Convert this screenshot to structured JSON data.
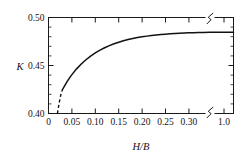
{
  "chart_data": {
    "type": "line",
    "title": "",
    "xlabel": "H/B",
    "ylabel": "K",
    "xlim": [
      0,
      0.345
    ],
    "ylim": [
      0.4,
      0.5
    ],
    "grid": false,
    "legend": null,
    "axis_break": {
      "axis": "x",
      "present": true,
      "between": [
        0.3,
        1.0
      ],
      "note": "zigzag break on top and bottom axis after 0.30"
    },
    "xticks": [
      0,
      0.05,
      0.1,
      0.15,
      0.2,
      0.25,
      0.3,
      1.0
    ],
    "xtick_labels": [
      "0",
      "0.05",
      "0.10",
      "0.15",
      "0.20",
      "0.25",
      "0.30",
      "1.0"
    ],
    "yticks": [
      0.4,
      0.45,
      0.5
    ],
    "ytick_labels": [
      "0.40",
      "0.45",
      "0.50"
    ],
    "y_minor_step": 0.01,
    "series": [
      {
        "name": "K vs H/B",
        "style": "solid",
        "x": [
          0.03,
          0.035,
          0.04,
          0.045,
          0.05,
          0.06,
          0.07,
          0.08,
          0.09,
          0.1,
          0.11,
          0.12,
          0.13,
          0.14,
          0.15,
          0.16,
          0.17,
          0.18,
          0.19,
          0.2,
          0.21,
          0.22,
          0.23,
          0.24,
          0.25,
          0.26,
          0.27,
          0.28,
          0.29,
          0.3,
          0.31,
          0.32,
          0.33,
          0.345
        ],
        "y": [
          0.425,
          0.4294,
          0.4334,
          0.4371,
          0.4405,
          0.4465,
          0.4516,
          0.456,
          0.4598,
          0.4631,
          0.466,
          0.4685,
          0.4707,
          0.4726,
          0.4743,
          0.4757,
          0.477,
          0.4781,
          0.4791,
          0.4799,
          0.4806,
          0.4812,
          0.4818,
          0.4822,
          0.4826,
          0.483,
          0.4833,
          0.4836,
          0.4838,
          0.484,
          0.4842,
          0.4844,
          0.4845,
          0.4847
        ]
      },
      {
        "name": "K vs H/B (extrapolated)",
        "style": "dashed",
        "x": [
          0.019,
          0.021,
          0.023,
          0.025,
          0.027,
          0.03
        ],
        "y": [
          0.4,
          0.406,
          0.4115,
          0.4165,
          0.421,
          0.425
        ]
      }
    ]
  },
  "axes": {
    "y_label": "K",
    "x_label": "H/B"
  },
  "colors": {
    "curve": "#111111",
    "axis": "#1a1a1a",
    "background": "#ffffff"
  }
}
